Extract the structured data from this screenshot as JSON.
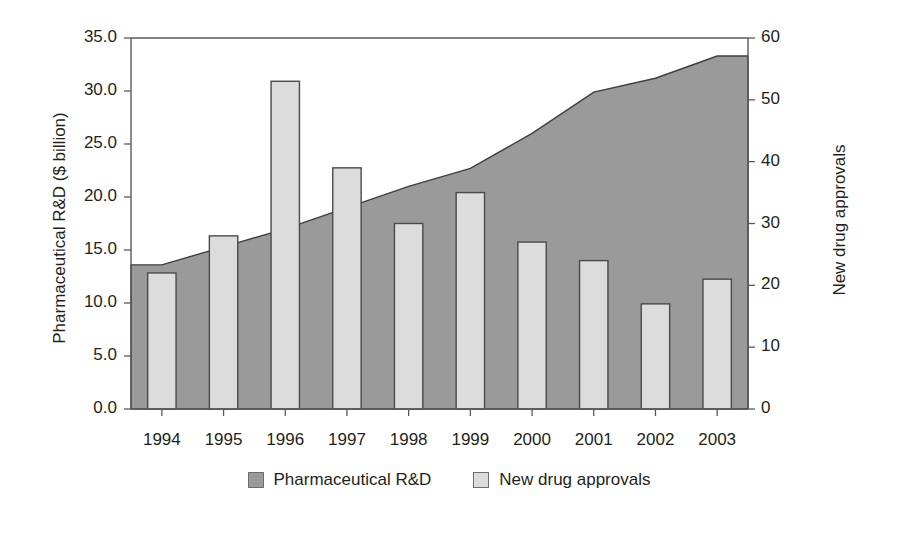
{
  "chart_data": {
    "type": "bar",
    "title": "",
    "xlabel": "",
    "categories": [
      "1994",
      "1995",
      "1996",
      "1997",
      "1998",
      "1999",
      "2000",
      "2001",
      "2002",
      "2003"
    ],
    "series": [
      {
        "name": "Pharmaceutical R&D",
        "type": "area",
        "axis": "left",
        "unit": "$ billion",
        "values": [
          13.6,
          15.3,
          17.0,
          19.0,
          21.0,
          22.7,
          26.0,
          29.9,
          31.2,
          33.3
        ],
        "color": "#9a9a9a"
      },
      {
        "name": "New drug approvals",
        "type": "bar",
        "axis": "right",
        "unit": "approvals",
        "values": [
          22,
          28,
          53,
          39,
          30,
          35,
          27,
          24,
          17,
          21
        ],
        "color": "#dcdcdc"
      }
    ],
    "left_axis": {
      "label": "Pharmaceutical R&D ($ billion)",
      "ylim": [
        0,
        35
      ],
      "ticks": [
        "0.0",
        "5.0",
        "10.0",
        "15.0",
        "20.0",
        "25.0",
        "30.0",
        "35.0"
      ],
      "tick_values": [
        0,
        5,
        10,
        15,
        20,
        25,
        30,
        35
      ]
    },
    "right_axis": {
      "label": "New drug approvals",
      "ylim": [
        0,
        60
      ],
      "ticks": [
        "0",
        "10",
        "20",
        "30",
        "40",
        "50",
        "60"
      ],
      "tick_values": [
        0,
        10,
        20,
        30,
        40,
        50,
        60
      ]
    },
    "grid": false,
    "legend_position": "bottom",
    "legend": [
      "Pharmaceutical R&D",
      "New drug approvals"
    ]
  },
  "legend": {
    "items": [
      {
        "label": "Pharmaceutical R&D"
      },
      {
        "label": "New drug approvals"
      }
    ]
  },
  "caption": {
    "text": ""
  }
}
